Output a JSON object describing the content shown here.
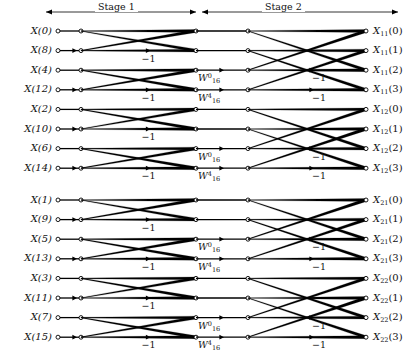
{
  "figure": {
    "kind": "fft-butterfly-signal-flow-graph",
    "stages": [
      {
        "id": "stage-1",
        "label": "Stage 1"
      },
      {
        "id": "stage-2",
        "label": "Stage 2"
      }
    ],
    "inputs": [
      {
        "text": "X(0)",
        "base": "X",
        "index": "0"
      },
      {
        "text": "X(8)",
        "base": "X",
        "index": "8"
      },
      {
        "text": "X(4)",
        "base": "X",
        "index": "4"
      },
      {
        "text": "X(12)",
        "base": "X",
        "index": "12"
      },
      {
        "text": "X(2)",
        "base": "X",
        "index": "2"
      },
      {
        "text": "X(10)",
        "base": "X",
        "index": "10"
      },
      {
        "text": "X(6)",
        "base": "X",
        "index": "6"
      },
      {
        "text": "X(14)",
        "base": "X",
        "index": "14"
      },
      {
        "text": "X(1)",
        "base": "X",
        "index": "1"
      },
      {
        "text": "X(9)",
        "base": "X",
        "index": "9"
      },
      {
        "text": "X(5)",
        "base": "X",
        "index": "5"
      },
      {
        "text": "X(13)",
        "base": "X",
        "index": "13"
      },
      {
        "text": "X(3)",
        "base": "X",
        "index": "3"
      },
      {
        "text": "X(11)",
        "base": "X",
        "index": "11"
      },
      {
        "text": "X(7)",
        "base": "X",
        "index": "7"
      },
      {
        "text": "X(15)",
        "base": "X",
        "index": "15"
      }
    ],
    "outputs": [
      {
        "base": "X",
        "sub": "11",
        "index": "0"
      },
      {
        "base": "X",
        "sub": "11",
        "index": "1"
      },
      {
        "base": "X",
        "sub": "11",
        "index": "2"
      },
      {
        "base": "X",
        "sub": "11",
        "index": "3"
      },
      {
        "base": "X",
        "sub": "12",
        "index": "0"
      },
      {
        "base": "X",
        "sub": "12",
        "index": "1"
      },
      {
        "base": "X",
        "sub": "12",
        "index": "2"
      },
      {
        "base": "X",
        "sub": "12",
        "index": "3"
      },
      {
        "base": "X",
        "sub": "21",
        "index": "0"
      },
      {
        "base": "X",
        "sub": "21",
        "index": "1"
      },
      {
        "base": "X",
        "sub": "21",
        "index": "2"
      },
      {
        "base": "X",
        "sub": "21",
        "index": "3"
      },
      {
        "base": "X",
        "sub": "22",
        "index": "0"
      },
      {
        "base": "X",
        "sub": "22",
        "index": "1"
      },
      {
        "base": "X",
        "sub": "22",
        "index": "2"
      },
      {
        "base": "X",
        "sub": "22",
        "index": "3"
      }
    ],
    "minus_one_label": "−1",
    "twiddles": [
      {
        "base": "W",
        "sup": "0",
        "sub": "16"
      },
      {
        "base": "W",
        "sup": "4",
        "sub": "16"
      }
    ],
    "stage1_minus_one_rows": [
      1,
      3,
      5,
      7,
      9,
      11,
      13,
      15
    ],
    "stage2_minus_one_rows": [
      2,
      3,
      6,
      7,
      10,
      11,
      14,
      15
    ],
    "stage2_twiddle_rows": [
      2,
      3,
      6,
      7,
      10,
      11,
      14,
      15
    ],
    "colors": {
      "line": "#000000",
      "node_fill": "#ffffff",
      "node_stroke": "#000000",
      "text": "#111111",
      "background": "#ffffff"
    }
  }
}
